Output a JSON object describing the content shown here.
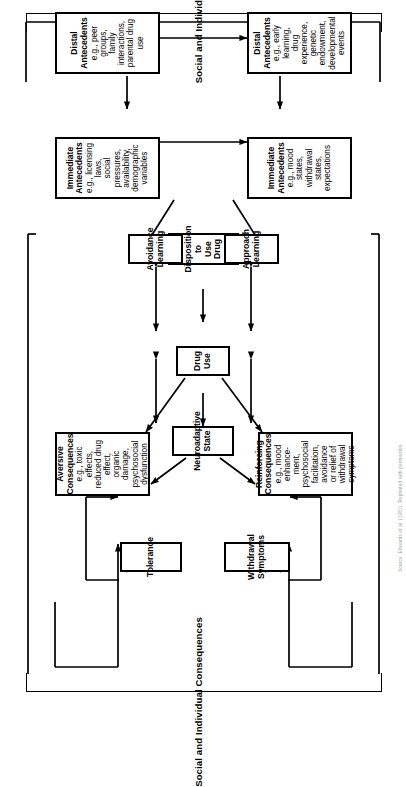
{
  "figure": {
    "orientation": "rotated-90-ccw",
    "section_labels": {
      "consequences": "Social and Individual Consequences",
      "antecedents": "Social and Individual Antecedents"
    },
    "caption_fragment": "Source: Edwards et al. (1981). Reprinted with permission."
  },
  "boxes": {
    "tolerance": {
      "title": "Tolerance",
      "sub": ""
    },
    "withdrawal_symptoms": {
      "title": "Withdrawal\nSymptoms",
      "title_line1": "Withdrawal",
      "title_line2": "Symptoms",
      "sub": ""
    },
    "neuroadaptive_state": {
      "title_line1": "Neuroadaptive",
      "title_line2": "State",
      "sub": ""
    },
    "aversive_consequences": {
      "title_line1": "Aversive",
      "title_line2": "Consequences",
      "sub_line1": "e.g., toxic effects,",
      "sub_line2": "reduced drug effect,",
      "sub_line3": "organic damage,",
      "sub_line4": "psychosocial",
      "sub_line5": "dysfunction"
    },
    "reinforcing_consequences": {
      "title_line1": "Reinforcing",
      "title_line2": "Consequences",
      "sub_line1": "e.g., mood enhance-",
      "sub_line2": "ment, psychosocial",
      "sub_line3": "facilitation, avoidance",
      "sub_line4": "or relief of withdrawal",
      "sub_line5": "symptoms"
    },
    "drug_use": {
      "title": "Drug Use",
      "sub": ""
    },
    "disposition_to_use_drug": {
      "title_line1": "Disposition",
      "title_line2": "to Use Drug",
      "sub": ""
    },
    "avoidance_learning": {
      "title_line1": "Avoidance",
      "title_line2": "Learning",
      "sub": ""
    },
    "approach_learning": {
      "title_line1": "Approach",
      "title_line2": "Learning",
      "sub": ""
    },
    "immediate_antecedents_social": {
      "title_line1": "Immediate",
      "title_line2": "Antecedents",
      "sub_line1": "e.g., licensing laws,",
      "sub_line2": "social pressures,",
      "sub_line3": "availability,",
      "sub_line4": "demographic variables"
    },
    "immediate_antecedents_individual": {
      "title_line1": "Immediate",
      "title_line2": "Antecedents",
      "sub_line1": "e.g., mood states,",
      "sub_line2": "withdrawal states,",
      "sub_line3": "expectations"
    },
    "distal_antecedents_social": {
      "title": "Distal Antecedents",
      "sub_line1": "e.g., peer groups,",
      "sub_line2": "family interactions,",
      "sub_line3": "parental drug use"
    },
    "distal_antecedents_individual": {
      "title": "Distal Antecedents",
      "sub_line1": "e.g., early learning,",
      "sub_line2": "drug experience,",
      "sub_line3": "genetic endowment,",
      "sub_line4": "developmental events"
    }
  },
  "colors": {
    "stroke": "#000000",
    "background": "#ffffff",
    "caption": "#9a9a9a"
  }
}
